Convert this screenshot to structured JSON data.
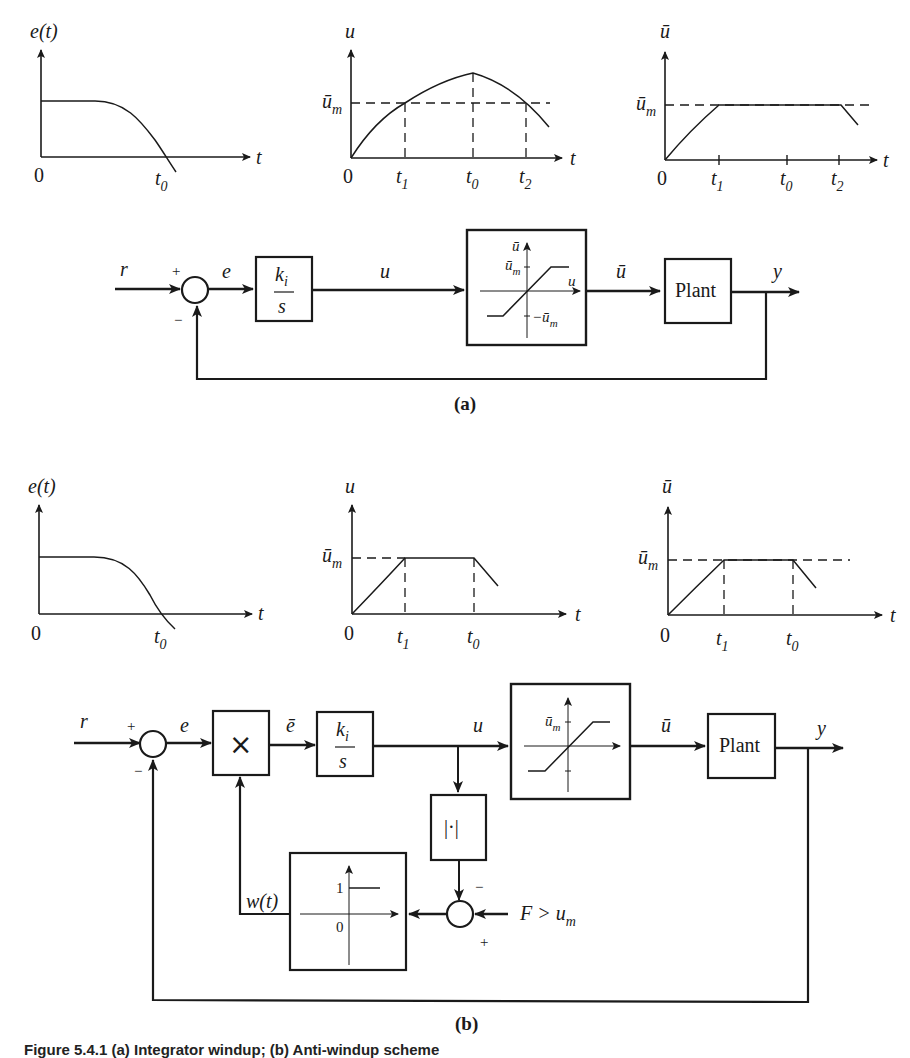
{
  "figure": {
    "part_a_label": "(a)",
    "part_b_label": "(b)",
    "caption": "Figure 5.4.1 (a) Integrator windup; (b) Anti-windup scheme"
  },
  "plots_a": {
    "error": {
      "ylabel": "e(t)",
      "xlabel": "t",
      "origin": "0",
      "ticks": [
        "t0"
      ]
    },
    "control": {
      "ylabel": "u",
      "xlabel": "t",
      "origin": "0",
      "level": "ū_m",
      "ticks": [
        "t1",
        "t0",
        "t2"
      ]
    },
    "saturated": {
      "ylabel": "ū",
      "xlabel": "t",
      "origin": "0",
      "level": "ū_m",
      "ticks": [
        "t1",
        "t0",
        "t2"
      ]
    }
  },
  "plots_b": {
    "error": {
      "ylabel": "e(t)",
      "xlabel": "t",
      "origin": "0",
      "ticks": [
        "t0"
      ]
    },
    "control": {
      "ylabel": "u",
      "xlabel": "t",
      "origin": "0",
      "level": "ū_m",
      "ticks": [
        "t1",
        "t0"
      ]
    },
    "saturated": {
      "ylabel": "ū",
      "xlabel": "t",
      "origin": "0",
      "level": "ū_m",
      "ticks": [
        "t1",
        "t0"
      ]
    }
  },
  "diagram_a": {
    "signals": {
      "r": "r",
      "e": "e",
      "u": "u",
      "ubar": "ū",
      "y": "y"
    },
    "signs": {
      "plus": "+",
      "minus": "−"
    },
    "integrator": {
      "num": "k",
      "num_sub": "i",
      "den": "s"
    },
    "saturation": {
      "y_axis": "ū",
      "x_axis": "u",
      "upper": "ū",
      "upper_sub": "m",
      "lower": "−ū",
      "lower_sub": "m"
    },
    "plant": "Plant"
  },
  "diagram_b": {
    "signals": {
      "r": "r",
      "e": "e",
      "ebar": "ē",
      "u": "u",
      "ubar": "ū",
      "y": "y",
      "w": "w(t)",
      "F": "F > u",
      "F_sub": "m"
    },
    "signs": {
      "plus": "+",
      "minus": "−"
    },
    "multiplier": "×",
    "integrator": {
      "num": "k",
      "num_sub": "i",
      "den": "s"
    },
    "saturation": {
      "upper": "ū",
      "upper_sub": "m"
    },
    "abs_block": "|·|",
    "switch": {
      "one": "1",
      "zero": "0"
    },
    "plant": "Plant"
  }
}
